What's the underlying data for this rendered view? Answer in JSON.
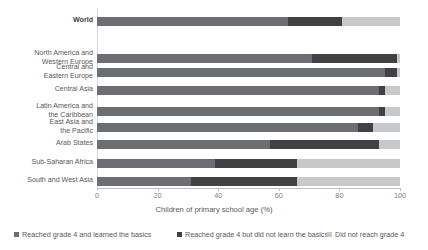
{
  "chart_data": {
    "type": "bar",
    "orientation": "horizontal",
    "stacked": true,
    "title": "",
    "xlabel": "Children of primary school age (%)",
    "ylabel": "",
    "xlim": [
      0,
      100
    ],
    "xticks": [
      0,
      20,
      40,
      60,
      80,
      100
    ],
    "xtick_labels": [
      "0",
      "20",
      "40",
      "60",
      "80",
      "100"
    ],
    "grid": false,
    "legend_position": "bottom",
    "categories": [
      "World",
      "North America and\nWestern Europe",
      "Central and\nEastern Europe",
      "Central Asia",
      "Latin America and\nthe Caribbean",
      "East Asia and\nthe Pacific",
      "Arab States",
      "Sub-Saharan Africa",
      "South and West Asia"
    ],
    "series": [
      {
        "name": "Reached grade 4 and learned the basics",
        "color": "#6d6e71",
        "values": [
          63,
          71,
          95,
          93,
          93,
          86,
          57,
          39,
          31
        ]
      },
      {
        "name": "Reached grade 4 but did not learn the basics",
        "color": "#414042",
        "values": [
          18,
          28,
          4,
          2,
          2,
          5,
          36,
          27,
          35
        ]
      },
      {
        "name": "Did not reach grade 4",
        "color": "#c7c8ca",
        "values": [
          19,
          1,
          1,
          5,
          5,
          9,
          7,
          34,
          34
        ]
      }
    ],
    "legend": [
      "Reached grade 4 and learned the basics",
      "Reached grade 4 but did not learn the basics",
      "Did not reach grade 4"
    ],
    "colors": {
      "learned": "#6d6e71",
      "not_learned": "#414042",
      "not_reached": "#c7c8ca",
      "axis": "#bcbec0",
      "text": "#58595b"
    }
  }
}
